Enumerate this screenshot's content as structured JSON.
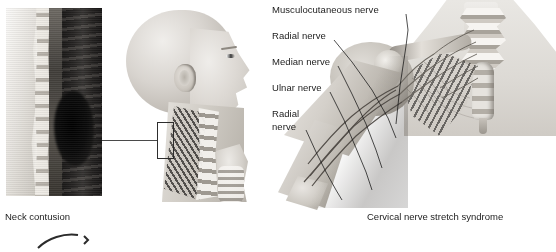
{
  "figure": {
    "background_color": "#ffffff",
    "text_color": "#1c1c1c",
    "style": "grayscale medical illustration"
  },
  "panels": {
    "mri": {
      "name": "sagittal cervical spine MRI slice",
      "caption": "Neck contusion"
    },
    "head": {
      "name": "lateral head and neck profile with cervical spine",
      "callout": "neck contusion region"
    },
    "plexus": {
      "name": "brachial plexus and arm with nerve branches",
      "caption": "Cervical nerve stretch syndrome"
    }
  },
  "nerve_labels": [
    {
      "id": "musculocutaneous",
      "text": "Musculocutaneous nerve"
    },
    {
      "id": "radial-upper",
      "text": "Radial nerve"
    },
    {
      "id": "median",
      "text": "Median nerve"
    },
    {
      "id": "ulnar",
      "text": "Ulnar nerve"
    },
    {
      "id": "radial-lower-line1",
      "text": "Radial"
    },
    {
      "id": "radial-lower-line2",
      "text": "nerve"
    }
  ],
  "captions": {
    "left": "Neck contusion",
    "right": "Cervical nerve stretch syndrome"
  }
}
